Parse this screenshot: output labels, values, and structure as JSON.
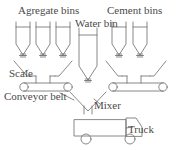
{
  "diagram": {
    "stroke_color": "#6b6b6b",
    "text_color": "#4a4a4a",
    "background_color": "#ffffff",
    "labels": {
      "aggregate_bins": "Agregate bins",
      "water_bin": "Water bin",
      "cement_bins": "Cement bins",
      "scale": "Scale",
      "conveyor_belt": "Conveyor belt",
      "mixer": "Mixer",
      "truck": "Truck"
    },
    "components": {
      "aggregate_bin_count": 3,
      "cement_bin_count": 2,
      "water_bin_count": 1,
      "scale_count": 2,
      "conveyor_belt_count": 2,
      "mixer_count": 1,
      "truck_count": 1,
      "gate_valve_count": 6
    }
  }
}
